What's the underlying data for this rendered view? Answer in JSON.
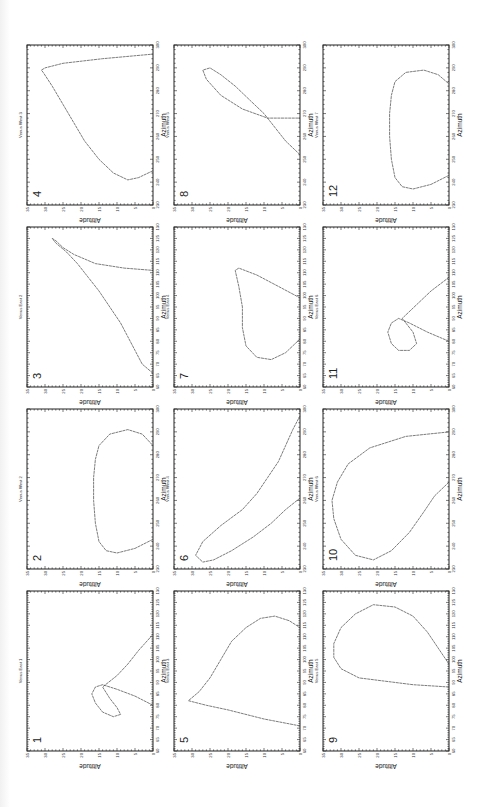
{
  "figure": {
    "layout": "3 columns x 4 rows of rotated (90° CCW) altitude-azimuth plots",
    "panels": [
      {
        "number": "1",
        "title": "Venus East 1",
        "xlabel": "Azimuth",
        "ylabel": "Altitude"
      },
      {
        "number": "2",
        "title": "Venus West 2",
        "xlabel": "Azimuth",
        "ylabel": "Altitude"
      },
      {
        "number": "3",
        "title": "Venus East 2",
        "xlabel": "Azimuth",
        "ylabel": "Altitude"
      },
      {
        "number": "4",
        "title": "Venus West 3",
        "xlabel": "Azimuth",
        "ylabel": "Altitude"
      },
      {
        "number": "5",
        "title": "Venus East 3",
        "xlabel": "Azimuth",
        "ylabel": "Altitude"
      },
      {
        "number": "6",
        "title": "Venus West 4",
        "xlabel": "Azimuth",
        "ylabel": "Altitude"
      },
      {
        "number": "7",
        "title": "Venus East 4",
        "xlabel": "Azimuth",
        "ylabel": "Altitude"
      },
      {
        "number": "8",
        "title": "Venus West 5",
        "xlabel": "Azimuth",
        "ylabel": "Altitude"
      },
      {
        "number": "9",
        "title": "Venus East 5",
        "xlabel": "Azimuth",
        "ylabel": "Altitude"
      },
      {
        "number": "10",
        "title": "Venus West 6",
        "xlabel": "Azimuth",
        "ylabel": "Altitude"
      },
      {
        "number": "11",
        "title": "Venus East 6",
        "xlabel": "Azimuth",
        "ylabel": "Altitude"
      },
      {
        "number": "12",
        "title": "Venus West 7",
        "xlabel": "Azimuth",
        "ylabel": "Altitude"
      }
    ]
  },
  "chart_data": [
    {
      "type": "line",
      "title": "Venus East 1",
      "panel": "1",
      "xlabel": "Azimuth",
      "ylabel": "Altitude",
      "xlim": [
        60,
        130
      ],
      "ylim": [
        0,
        35
      ],
      "xticks": [
        60,
        65,
        70,
        75,
        80,
        85,
        90,
        95,
        100,
        105,
        110,
        115,
        120,
        125,
        130
      ],
      "yticks": [
        0,
        5,
        10,
        15,
        20,
        25,
        30,
        35
      ],
      "x": [
        80,
        84,
        87,
        89,
        88,
        85,
        81,
        77,
        75,
        76,
        79,
        83,
        88,
        93,
        98,
        104,
        111
      ],
      "y": [
        0,
        5,
        10,
        14,
        16,
        17,
        16,
        14,
        11,
        9,
        10,
        12,
        14,
        10,
        7,
        4,
        0
      ]
    },
    {
      "type": "line",
      "title": "Venus West 2",
      "panel": "2",
      "xlabel": "Azimuth",
      "ylabel": "Altitude",
      "xlim": [
        230,
        300
      ],
      "ylim": [
        0,
        35
      ],
      "xticks": [
        230,
        240,
        250,
        260,
        270,
        280,
        290,
        300
      ],
      "yticks": [
        0,
        5,
        10,
        15,
        20,
        25,
        30,
        35
      ],
      "x": [
        243,
        239,
        237,
        238,
        242,
        250,
        260,
        270,
        278,
        284,
        289,
        291,
        289,
        284
      ],
      "y": [
        0,
        5,
        10,
        13,
        15,
        16,
        16.5,
        16.5,
        16,
        15,
        12,
        7,
        3,
        0
      ]
    },
    {
      "type": "line",
      "title": "Venus East 2",
      "panel": "3",
      "xlabel": "Azimuth",
      "ylabel": "Altitude",
      "xlim": [
        60,
        130
      ],
      "ylim": [
        0,
        35
      ],
      "xticks": [
        60,
        65,
        70,
        75,
        80,
        85,
        90,
        95,
        100,
        105,
        110,
        115,
        120,
        125,
        130
      ],
      "yticks": [
        0,
        5,
        10,
        15,
        20,
        25,
        30,
        35
      ],
      "x": [
        66,
        70,
        76,
        82,
        88,
        95,
        102,
        108,
        114,
        119,
        123,
        125,
        124,
        121,
        118,
        114,
        112,
        111
      ],
      "y": [
        0,
        3,
        5,
        7,
        9,
        12,
        15,
        18,
        21,
        24,
        27,
        28,
        27,
        25,
        22,
        16,
        8,
        0
      ]
    },
    {
      "type": "line",
      "title": "Venus West 3",
      "panel": "4",
      "xlabel": "Azimuth",
      "ylabel": "Altitude",
      "xlim": [
        230,
        300
      ],
      "ylim": [
        0,
        35
      ],
      "xticks": [
        230,
        240,
        250,
        260,
        270,
        280,
        290,
        300
      ],
      "yticks": [
        0,
        5,
        10,
        15,
        20,
        25,
        30,
        35
      ],
      "x": [
        245,
        242,
        241,
        244,
        250,
        258,
        266,
        274,
        282,
        288,
        289,
        290,
        292,
        294,
        296
      ],
      "y": [
        0,
        4,
        7,
        11,
        15,
        19,
        22,
        25,
        28,
        30.5,
        31,
        30,
        25,
        14,
        0
      ]
    },
    {
      "type": "line",
      "title": "Venus East 3",
      "panel": "5",
      "xlabel": "Azimuth",
      "ylabel": "Altitude",
      "xlim": [
        60,
        130
      ],
      "ylim": [
        0,
        35
      ],
      "xticks": [
        60,
        65,
        70,
        75,
        80,
        85,
        90,
        95,
        100,
        105,
        110,
        115,
        120,
        125,
        130
      ],
      "yticks": [
        0,
        5,
        10,
        15,
        20,
        25,
        30,
        35
      ],
      "x": [
        71,
        74,
        78,
        80,
        82,
        86,
        92,
        100,
        108,
        114,
        118,
        119,
        117,
        114
      ],
      "y": [
        0,
        10,
        20,
        26,
        31,
        28,
        25,
        22,
        19,
        15,
        11,
        7,
        3,
        0
      ]
    },
    {
      "type": "line",
      "title": "Venus West 4",
      "panel": "6",
      "xlabel": "Azimuth",
      "ylabel": "Altitude",
      "xlim": [
        230,
        300
      ],
      "ylim": [
        0,
        35
      ],
      "xticks": [
        230,
        240,
        250,
        260,
        270,
        280,
        290,
        300
      ],
      "yticks": [
        0,
        5,
        10,
        15,
        20,
        25,
        30,
        35
      ],
      "x": [
        261,
        256,
        250,
        244,
        238,
        234,
        233,
        236,
        242,
        249,
        256,
        263,
        270,
        277,
        284,
        291,
        297
      ],
      "y": [
        0,
        4,
        8,
        13,
        19,
        24,
        27,
        29,
        27,
        22,
        16,
        12,
        9,
        6,
        4,
        2,
        0
      ]
    },
    {
      "type": "line",
      "title": "Venus East 4",
      "panel": "7",
      "xlabel": "Azimuth",
      "ylabel": "Altitude",
      "xlim": [
        60,
        130
      ],
      "ylim": [
        0,
        35
      ],
      "xticks": [
        60,
        65,
        70,
        75,
        80,
        85,
        90,
        95,
        100,
        105,
        110,
        115,
        120,
        125,
        130
      ],
      "yticks": [
        0,
        5,
        10,
        15,
        20,
        25,
        30,
        35
      ],
      "x": [
        81,
        75,
        72,
        73,
        78,
        86,
        95,
        104,
        111,
        112,
        109,
        104,
        99
      ],
      "y": [
        0,
        4,
        8,
        12,
        15,
        16,
        16,
        17,
        18,
        17,
        12,
        6,
        0
      ]
    },
    {
      "type": "line",
      "title": "Venus West 5",
      "panel": "8",
      "xlabel": "Azimuth",
      "ylabel": "Altitude",
      "xlim": [
        230,
        300
      ],
      "ylim": [
        0,
        35
      ],
      "xticks": [
        230,
        240,
        250,
        260,
        270,
        280,
        290,
        300
      ],
      "yticks": [
        0,
        5,
        10,
        15,
        20,
        25,
        30,
        35
      ],
      "x": [
        252,
        258,
        264,
        270,
        276,
        282,
        287,
        290,
        289,
        285,
        278,
        272,
        268,
        268
      ],
      "y": [
        0,
        4,
        7,
        10,
        14,
        18,
        22,
        25,
        27,
        26,
        22,
        16,
        9,
        0
      ]
    },
    {
      "type": "line",
      "title": "Venus East 5",
      "panel": "9",
      "xlabel": "Azimuth",
      "ylabel": "Altitude",
      "xlim": [
        60,
        130
      ],
      "ylim": [
        0,
        35
      ],
      "xticks": [
        60,
        65,
        70,
        75,
        80,
        85,
        90,
        95,
        100,
        105,
        110,
        115,
        120,
        125,
        130
      ],
      "yticks": [
        0,
        5,
        10,
        15,
        20,
        25,
        30,
        35
      ],
      "x": [
        88,
        89,
        92,
        96,
        101,
        107,
        114,
        120,
        124,
        123,
        119,
        112,
        105,
        98
      ],
      "y": [
        0,
        10,
        25,
        30,
        32,
        32,
        30,
        26,
        21,
        15,
        10,
        6,
        3,
        0
      ]
    },
    {
      "type": "line",
      "title": "Venus West 6",
      "panel": "10",
      "xlabel": "Azimuth",
      "ylabel": "Altitude",
      "xlim": [
        230,
        300
      ],
      "ylim": [
        0,
        35
      ],
      "xticks": [
        230,
        240,
        250,
        260,
        270,
        280,
        290,
        300
      ],
      "yticks": [
        0,
        5,
        10,
        15,
        20,
        25,
        30,
        35
      ],
      "x": [
        268,
        262,
        255,
        246,
        238,
        234,
        236,
        243,
        252,
        260,
        268,
        276,
        283,
        288,
        290
      ],
      "y": [
        0,
        4,
        7,
        11,
        16,
        21,
        26,
        30,
        32,
        32.5,
        31,
        28,
        22,
        12,
        0
      ]
    },
    {
      "type": "line",
      "title": "Venus East 6",
      "panel": "11",
      "xlabel": "Azimuth",
      "ylabel": "Altitude",
      "xlim": [
        60,
        130
      ],
      "ylim": [
        0,
        35
      ],
      "xticks": [
        60,
        65,
        70,
        75,
        80,
        85,
        90,
        95,
        100,
        105,
        110,
        115,
        120,
        125,
        130
      ],
      "yticks": [
        0,
        5,
        10,
        15,
        20,
        25,
        30,
        35
      ],
      "x": [
        80,
        84,
        88,
        90,
        88,
        84,
        79,
        76,
        76,
        79,
        84,
        90,
        96,
        102,
        108
      ],
      "y": [
        0,
        6,
        11,
        14,
        16,
        17,
        16,
        14,
        11,
        9,
        10,
        13,
        9,
        5,
        0
      ]
    },
    {
      "type": "line",
      "title": "Venus West 7",
      "panel": "12",
      "xlabel": "Azimuth",
      "ylabel": "Altitude",
      "xlim": [
        230,
        300
      ],
      "ylim": [
        0,
        35
      ],
      "xticks": [
        230,
        240,
        250,
        260,
        270,
        280,
        290,
        300
      ],
      "yticks": [
        0,
        5,
        10,
        15,
        20,
        25,
        30,
        35
      ],
      "x": [
        243,
        239,
        237,
        238,
        242,
        250,
        260,
        270,
        278,
        284,
        288,
        289,
        287,
        283
      ],
      "y": [
        0,
        5,
        10,
        13,
        15,
        16,
        16.5,
        16.5,
        16,
        15,
        12,
        7,
        3,
        0
      ]
    }
  ]
}
